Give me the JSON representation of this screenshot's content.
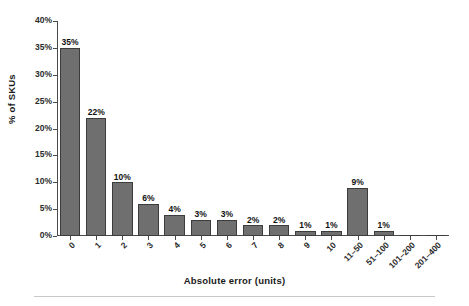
{
  "chart_data": {
    "type": "bar",
    "title": "",
    "xlabel": "Absolute error (units)",
    "ylabel": "% of SKUs",
    "categories": [
      "0",
      "1",
      "2",
      "3",
      "4",
      "5",
      "6",
      "7",
      "8",
      "9",
      "10",
      "11–50",
      "51–100",
      "101–200",
      "201–400"
    ],
    "values": [
      35,
      22,
      10,
      6,
      4,
      3,
      3,
      2,
      2,
      1,
      1,
      9,
      1,
      0,
      0
    ],
    "value_labels": [
      "35%",
      "22%",
      "10%",
      "6%",
      "4%",
      "3%",
      "3%",
      "2%",
      "2%",
      "1%",
      "1%",
      "9%",
      "1%",
      "",
      ""
    ],
    "ylim": [
      0,
      40
    ],
    "ytick_values": [
      0,
      5,
      10,
      15,
      20,
      25,
      30,
      35,
      40
    ],
    "ytick_labels": [
      "0%",
      "5%",
      "10%",
      "15%",
      "20%",
      "25%",
      "30%",
      "35%",
      "40%"
    ],
    "grid": false,
    "legend": null,
    "bar_color": "#6f6f6f",
    "bar_edge_color": "#3c3c3c",
    "axis_color": "#4a4a4a",
    "background": "#ffffff"
  }
}
